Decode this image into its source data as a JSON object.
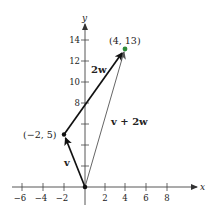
{
  "figure": {
    "axes": {
      "x_label": "x",
      "y_label": "y",
      "x_ticks": [
        {
          "value": -6,
          "label": "−6"
        },
        {
          "value": -4,
          "label": "−4"
        },
        {
          "value": -2,
          "label": "−2"
        },
        {
          "value": 2,
          "label": "2"
        },
        {
          "value": 4,
          "label": "4"
        },
        {
          "value": 6,
          "label": "6"
        },
        {
          "value": 8,
          "label": "8"
        }
      ],
      "y_ticks": [
        {
          "value": 2,
          "label": ""
        },
        {
          "value": 4,
          "label": ""
        },
        {
          "value": 6,
          "label": ""
        },
        {
          "value": 8,
          "label": "8"
        },
        {
          "value": 10,
          "label": "10"
        },
        {
          "value": 12,
          "label": "12"
        },
        {
          "value": 14,
          "label": "14"
        }
      ]
    },
    "points": [
      {
        "id": "p1",
        "coords": [
          -2,
          5
        ],
        "label": "(−2, 5)"
      },
      {
        "id": "p2",
        "coords": [
          4,
          13
        ],
        "label": "(4, 13)",
        "color": "#2e8b3a"
      }
    ],
    "vectors": [
      {
        "id": "v",
        "from": [
          0,
          0
        ],
        "to": [
          -2,
          5
        ],
        "label": "v",
        "color": "#111111"
      },
      {
        "id": "2w",
        "from": [
          -2,
          5
        ],
        "to": [
          4,
          13
        ],
        "label": "2w",
        "color": "#111111"
      },
      {
        "id": "v_plus_2w",
        "from": [
          0,
          0
        ],
        "to": [
          4,
          13
        ],
        "label": "v + 2w",
        "color": "#777777"
      }
    ]
  }
}
